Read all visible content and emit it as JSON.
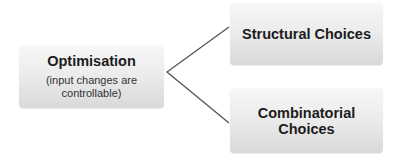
{
  "diagram": {
    "root": {
      "title": "Optimisation",
      "subtitle_line1": "(input changes are",
      "subtitle_line2": "controllable)"
    },
    "children": [
      {
        "title": "Structural Choices"
      },
      {
        "title_line1": "Combinatorial",
        "title_line2": "Choices"
      }
    ],
    "connector_color": "#555555"
  }
}
